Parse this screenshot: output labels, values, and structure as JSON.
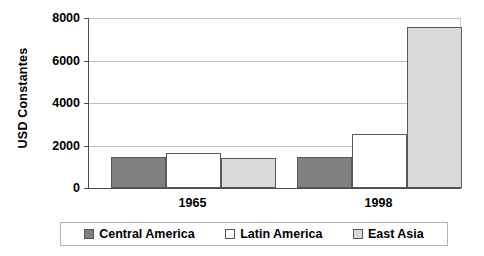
{
  "chart_data": {
    "type": "bar",
    "title": "",
    "subtitle": "",
    "xlabel": "",
    "ylabel": "USD Constantes",
    "categories": [
      "1965",
      "1998"
    ],
    "series": [
      {
        "name": "Central America",
        "values": [
          1450,
          1460
        ],
        "color": "#808080"
      },
      {
        "name": "Latin America",
        "values": [
          1650,
          2560
        ],
        "color": "#ffffff"
      },
      {
        "name": "East Asia",
        "values": [
          1420,
          7580
        ],
        "color": "#d9d9d9"
      }
    ],
    "ylim": [
      0,
      8000
    ],
    "ytick_labels": [
      "0",
      "2000",
      "4000",
      "6000",
      "8000"
    ],
    "ytick_values": [
      0,
      2000,
      4000,
      6000,
      8000
    ],
    "grid": true,
    "grid_axis": "y",
    "legend_position": "bottom",
    "axis_color": "#4d4d4d",
    "grid_color": "#c0c0c0",
    "bar_border_color": "#595959",
    "background": "#ffffff"
  }
}
